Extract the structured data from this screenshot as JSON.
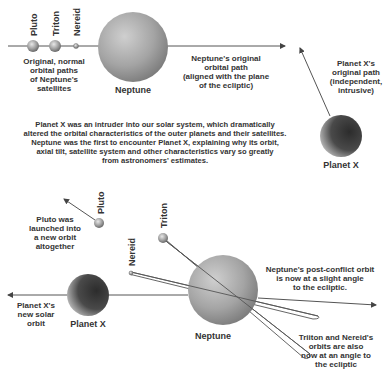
{
  "top": {
    "satellites": [
      {
        "name": "Pluto",
        "x": 33,
        "y": 46,
        "r": 6
      },
      {
        "name": "Triton",
        "x": 55,
        "y": 46,
        "r": 6
      },
      {
        "name": "Nereid",
        "x": 76,
        "y": 46,
        "r": 2.5
      }
    ],
    "satellites_caption": [
      "Original, normal",
      "orbital paths",
      "of Neptune's",
      "satellites"
    ],
    "neptune_label": "Neptune",
    "neptune_path_caption": [
      "Neptune's original",
      "orbital path",
      "(aligned with the plane",
      "of the ecliptic)"
    ],
    "planetx_path_caption": [
      "Planet X's",
      "original path",
      "(independent,",
      "intrusive)"
    ],
    "planetx_label": "Planet X"
  },
  "middle_text": [
    "Planet X was an intruder into our solar system, which dramatically",
    "altered the orbital characteristics of the outer planets and their satellites.",
    "Neptune was the first to encounter Planet X, explaining why its orbit,",
    "axial tilt, satellite system and other characteristics vary so greatly",
    "from astronomers' estimates."
  ],
  "bottom": {
    "pluto_label": "Pluto",
    "pluto_caption": [
      "Pluto was",
      "launched into",
      "a new orbit",
      "altogether"
    ],
    "triton_label": "Triton",
    "nereid_label": "Nereid",
    "planetx_label": "Planet X",
    "planetx_caption": [
      "Planet X's",
      "new solar",
      "orbit"
    ],
    "neptune_label": "Neptune",
    "neptune_orbit_caption": [
      "Neptune's post-conflict orbit",
      "is now at a slight angle",
      "to the ecliptic."
    ],
    "moons_caption": [
      "Triiton and Nereid's",
      "orbits are also",
      "now at an angle to",
      "the ecliptic"
    ]
  },
  "colors": {
    "line": "#555555",
    "text": "#333333",
    "neptune": "#a8a8a8",
    "planetx": "#3a3a3a"
  }
}
